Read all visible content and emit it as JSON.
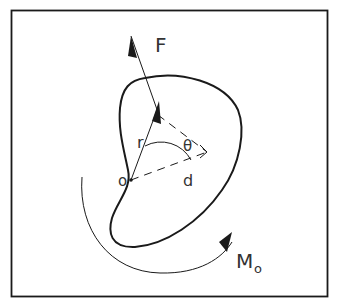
{
  "diagram": {
    "labels": {
      "force": "F",
      "position_vector": "r",
      "angle": "θ",
      "moment_arm": "d",
      "origin": "o",
      "moment": "M",
      "moment_subscript": "o"
    },
    "colors": {
      "stroke": "#1a1a1a",
      "text": "#333333",
      "background": "#ffffff"
    }
  }
}
